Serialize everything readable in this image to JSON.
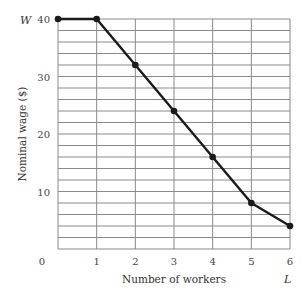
{
  "chart_data": {
    "type": "line",
    "title": "",
    "xlabel": "Number of workers",
    "ylabel": "Nominal wage ($)",
    "x_axis_symbol": "L",
    "y_axis_symbol": "W",
    "origin_label": "0",
    "x": [
      0,
      1,
      2,
      3,
      4,
      5,
      6
    ],
    "x_tick_labels": [
      "1",
      "2",
      "3",
      "4",
      "5",
      "6"
    ],
    "y_tick_labels": [
      "10",
      "20",
      "30",
      "40"
    ],
    "series": [
      {
        "name": "Nominal wage",
        "values": [
          40,
          40,
          32,
          24,
          16,
          8,
          4
        ]
      }
    ],
    "xlim": [
      0,
      6
    ],
    "ylim": [
      0,
      40
    ],
    "grid": true,
    "grid_x_step": 1,
    "grid_y_step": 2,
    "legend": "none",
    "markers": true
  },
  "colors": {
    "line": "#1a1a1a",
    "grid": "#8a8a8a",
    "text": "#444444"
  }
}
